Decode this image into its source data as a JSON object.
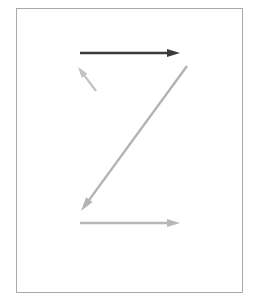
{
  "figure": {
    "background_color": "#ffffff",
    "frame": {
      "name": "bounding-box-frame",
      "x": 16,
      "y": 8,
      "width": 227,
      "height": 285,
      "stroke_color": "#a9a9a9",
      "stroke_width": 1,
      "fill_color": "#ffffff"
    },
    "arrows": [
      {
        "id": "top-horizontal-arrow",
        "label": "top horizontal arrow pointing right",
        "direction": "right",
        "color": "#3a3a3a",
        "stroke_width": 2.6,
        "x1": 80,
        "y1": 53,
        "x2": 180,
        "y2": 53,
        "head_length": 13,
        "head_width": 8
      },
      {
        "id": "short-diagonal-arrow",
        "label": "short diagonal arrow pointing up-left",
        "direction": "up-left",
        "color": "#c2c2c2",
        "stroke_width": 2.2,
        "x1": 96,
        "y1": 91,
        "x2": 78,
        "y2": 67,
        "head_length": 11,
        "head_width": 7
      },
      {
        "id": "long-diagonal-arrow",
        "label": "long diagonal arrow pointing down-left",
        "direction": "down-left",
        "color": "#b3b3b3",
        "stroke_width": 2.4,
        "x1": 187,
        "y1": 66,
        "x2": 81,
        "y2": 211,
        "head_length": 14,
        "head_width": 8
      },
      {
        "id": "bottom-horizontal-arrow",
        "label": "bottom horizontal arrow pointing right",
        "direction": "right",
        "color": "#b8b8b8",
        "stroke_width": 2.4,
        "x1": 80,
        "y1": 223,
        "x2": 180,
        "y2": 223,
        "head_length": 13,
        "head_width": 8
      }
    ]
  }
}
